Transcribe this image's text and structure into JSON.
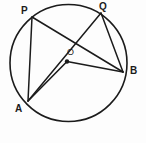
{
  "figure": {
    "background_color": "#fdfdfd",
    "stroke_color": "#1b1b1b",
    "circle": {
      "name": "circle",
      "cx": 68.5,
      "cy": 63,
      "r": 58.5
    },
    "center_point": {
      "label": "O",
      "x": 67,
      "y": 61.5,
      "dot_radius": 2.2,
      "label_x": 67,
      "label_y": 48
    },
    "points": [
      {
        "id": "P",
        "label": "P",
        "x": 32,
        "y": 17,
        "label_x": 21,
        "label_y": 6
      },
      {
        "id": "Q",
        "label": "Q",
        "x": 101,
        "y": 13,
        "label_x": 99,
        "label_y": 2
      },
      {
        "id": "B",
        "label": "B",
        "x": 123,
        "y": 72,
        "label_x": 130,
        "label_y": 66
      },
      {
        "id": "A",
        "label": "A",
        "x": 28,
        "y": 101,
        "label_x": 15,
        "label_y": 104
      }
    ],
    "segments": [
      {
        "id": "PA",
        "from": "P",
        "to": "A",
        "kind": "chord",
        "x1": 32,
        "y1": 17,
        "x2": 28,
        "y2": 101
      },
      {
        "id": "PB",
        "from": "P",
        "to": "B",
        "kind": "chord",
        "x1": 32,
        "y1": 17,
        "x2": 123,
        "y2": 72
      },
      {
        "id": "QA",
        "from": "Q",
        "to": "A",
        "kind": "chord",
        "x1": 101,
        "y1": 13,
        "x2": 28,
        "y2": 101
      },
      {
        "id": "QB",
        "from": "Q",
        "to": "B",
        "kind": "chord",
        "x1": 101,
        "y1": 13,
        "x2": 123,
        "y2": 72
      },
      {
        "id": "OA",
        "from": "O",
        "to": "A",
        "kind": "radius",
        "x1": 67,
        "y1": 61.5,
        "x2": 28,
        "y2": 101
      },
      {
        "id": "OB",
        "from": "O",
        "to": "B",
        "kind": "radius",
        "x1": 67,
        "y1": 61.5,
        "x2": 123,
        "y2": 72
      }
    ]
  }
}
